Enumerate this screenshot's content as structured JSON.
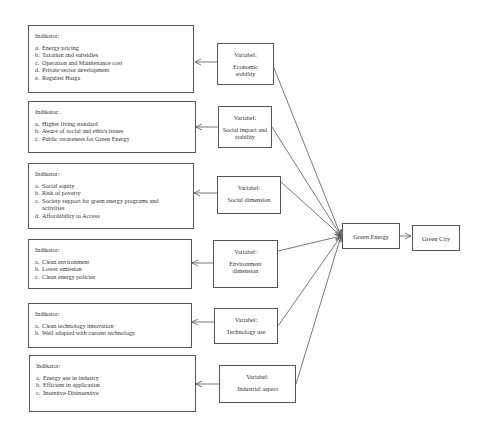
{
  "diagram": {
    "indicator_groups": [
      {
        "heading": "Indikator:",
        "items": [
          {
            "marker": "a.",
            "text": "Energy pricing"
          },
          {
            "marker": "b.",
            "text": "Taxation and subsidies"
          },
          {
            "marker": "c.",
            "text": "Operation and Maintenance cost"
          },
          {
            "marker": "d.",
            "text": "Private sector development"
          },
          {
            "marker": "e.",
            "text": "Regulasi Harga"
          }
        ]
      },
      {
        "heading": "Indikator:",
        "items": [
          {
            "marker": "a.",
            "text": "Higher living standard"
          },
          {
            "marker": "b.",
            "text": "Aware of social and ethics issues"
          },
          {
            "marker": "c.",
            "text": "Public awareness for Green Energy"
          }
        ]
      },
      {
        "heading": "Indikator:",
        "items": [
          {
            "marker": "a.",
            "text": "Social equity"
          },
          {
            "marker": "b.",
            "text": "Risk of poverty"
          },
          {
            "marker": "c.",
            "text": "Society support for green energy programs and activities"
          },
          {
            "marker": "d.",
            "text": "Affordability to Access"
          }
        ]
      },
      {
        "heading": "Indikator:",
        "items": [
          {
            "marker": "a.",
            "text": "Clean environment"
          },
          {
            "marker": "b.",
            "text": "Lower emission"
          },
          {
            "marker": "c.",
            "text": "Clean energy policies"
          }
        ]
      },
      {
        "heading": "Indikator:",
        "items": [
          {
            "marker": "a.",
            "text": "Clean technology innovation"
          },
          {
            "marker": "b.",
            "text": "Well adapted with current technology"
          }
        ]
      },
      {
        "heading": "Indikator:",
        "items": [
          {
            "marker": "a.",
            "text": "Energy use in industry"
          },
          {
            "marker": "b.",
            "text": "Efficient in application"
          },
          {
            "marker": "c.",
            "text": "Insentive-Disinsentive"
          }
        ]
      }
    ],
    "variables": [
      {
        "heading": "Variabel:",
        "name": "Economic stability"
      },
      {
        "heading": "Variabel:",
        "name": "Social impact and stability"
      },
      {
        "heading": "Variabel:",
        "name": "Social dimension"
      },
      {
        "heading": "Variabel:",
        "name": "Environment dimension"
      },
      {
        "heading": "Variabel:",
        "name": "Technology use"
      },
      {
        "heading": "Variabel:",
        "name": "Industrial aspect"
      }
    ],
    "hub": {
      "label": "Green Energy"
    },
    "outcome": {
      "label": "Green City"
    },
    "colors": {
      "line": "#555555",
      "border": "#555555",
      "text": "#333333",
      "background": "#ffffff"
    }
  }
}
